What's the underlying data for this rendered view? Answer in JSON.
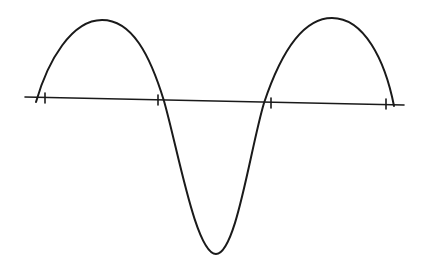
{
  "diagram": {
    "colors": {
      "background": "#ffffff",
      "ink": "#1a1a1a"
    },
    "axis": {
      "x1": 25,
      "y1": 97,
      "x2": 404,
      "y2": 105
    },
    "ticks": [
      {
        "x": 45,
        "y": 98
      },
      {
        "x": 158,
        "y": 100
      },
      {
        "x": 271,
        "y": 103
      },
      {
        "x": 386,
        "y": 104
      }
    ],
    "curve_path": "M 36 102 C 48 60, 72 20, 102 20 C 132 20, 150 55, 164 101 C 178 150, 196 254, 216 254 C 236 254, 250 150, 264 103 C 280 55, 302 18, 332 18 C 364 18, 385 60, 394 106"
  }
}
